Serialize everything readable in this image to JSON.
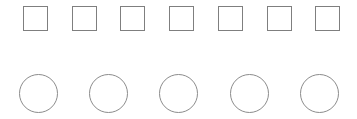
{
  "canvas": {
    "width": 357,
    "height": 119,
    "background_color": "#ffffff"
  },
  "rows": [
    {
      "name": "squares-row",
      "shape_type": "square",
      "count": 7,
      "size": 25,
      "top": 6,
      "first_left": 23,
      "pitch": 48.7,
      "stroke_color": "#7f7f7f",
      "stroke_width": 1,
      "fill_color": "transparent"
    },
    {
      "name": "circles-row",
      "shape_type": "circle",
      "count": 5,
      "size": 39,
      "top": 74,
      "first_left": 19,
      "pitch": 70.2,
      "stroke_color": "#8c8c8c",
      "stroke_width": 1,
      "fill_color": "transparent"
    }
  ]
}
